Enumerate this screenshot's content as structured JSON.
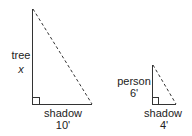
{
  "diagram": {
    "type": "similar-triangles",
    "tree_triangle": {
      "height_label": "tree",
      "height_value": "x",
      "base_label": "shadow",
      "base_value": "10'"
    },
    "person_triangle": {
      "height_label": "person",
      "height_value": "6'",
      "base_label": "shadow",
      "base_value": "4'"
    },
    "colors": {
      "line": "#333333",
      "background": "#ffffff"
    }
  }
}
